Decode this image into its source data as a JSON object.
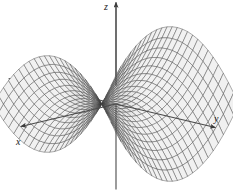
{
  "figure": {
    "title": "",
    "background_color": "#ffffff",
    "width": 233,
    "height": 190
  },
  "axes": {
    "z": {
      "label": "z",
      "icon": "arrow-up-icon",
      "direction": "up"
    },
    "x": {
      "label": "x",
      "icon": "arrow-down-left-icon",
      "direction": "down-left"
    },
    "y": {
      "label": "y",
      "icon": "arrow-right-icon",
      "direction": "right"
    }
  },
  "chart_data": {
    "type": "surface",
    "title": "",
    "xlabel": "x",
    "ylabel": "y",
    "zlabel": "z",
    "surface_equation": "z = x^2 - y^2",
    "surface_name": "hyperbolic paraboloid (saddle surface)",
    "projection": "axonometric",
    "grid": true,
    "legend": "none",
    "xlim": [
      -1,
      1
    ],
    "ylim": [
      -1,
      1
    ],
    "zlim": [
      -1,
      1
    ],
    "mesh": {
      "u_divisions": 24,
      "v_divisions": 24,
      "line_color": "#3a3a3a",
      "fill_color": "#d8d8d8",
      "line_width": 0.45
    },
    "axis_color": "#4a4a4a",
    "axis_line_width": 1.1,
    "camera": {
      "elevation_deg": 22,
      "azimuth_deg": 40
    },
    "rendered_rays": [
      {
        "name": "z-positive",
        "visible": true,
        "arrow": true
      },
      {
        "name": "z-negative",
        "visible": true,
        "arrow": false
      },
      {
        "name": "y-positive",
        "visible": true,
        "arrow": true
      },
      {
        "name": "y-negative",
        "visible": true,
        "arrow": false
      },
      {
        "name": "x-positive",
        "visible": true,
        "arrow": true
      },
      {
        "name": "x-negative",
        "visible": true,
        "arrow": false
      }
    ]
  }
}
